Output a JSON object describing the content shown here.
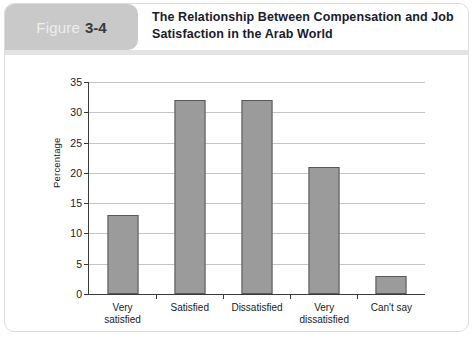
{
  "figure": {
    "tab_word": "Figure",
    "tab_number": "3-4",
    "title_line1": "The Relationship Between Compensation and Job",
    "title_line2": "Satisfaction in the Arab World"
  },
  "colors": {
    "tab_background": "#c9c9c9",
    "tab_word": "#eeeeee",
    "tab_number": "#3a3a3a",
    "title": "#1b1b2b",
    "bar_fill": "#9b9b9b",
    "bar_border": "#585858",
    "gridline": "#c4c4c4",
    "axis": "#3a3a3a",
    "frame_border": "#dcdcdc"
  },
  "chart_data": {
    "type": "bar",
    "title": "The Relationship Between Compensation and Job Satisfaction in the Arab World",
    "categories": [
      "Very\nsatisfied",
      "Satisfied",
      "Dissatisfied",
      "Very\ndissatisfied",
      "Can't say"
    ],
    "values": [
      13,
      32,
      32,
      21,
      3
    ],
    "xlabel": "",
    "ylabel": "Percentage",
    "ylim": [
      0,
      35
    ],
    "yticks": [
      0,
      5,
      10,
      15,
      20,
      25,
      30,
      35
    ],
    "ytick_labels": [
      "0",
      "5",
      "10",
      "15",
      "20",
      "25",
      "30",
      "35"
    ],
    "grid": true,
    "grid_axis": "y",
    "legend": false
  }
}
